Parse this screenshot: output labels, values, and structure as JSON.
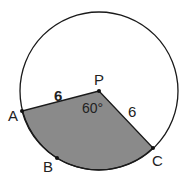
{
  "diagram": {
    "type": "circle-sector",
    "center_label": "P",
    "points": {
      "A": "A",
      "B": "B",
      "C": "C"
    },
    "radius_label_PA": "6",
    "radius_label_PC": "6",
    "angle_label": "60°",
    "colors": {
      "shade": "#8a8a8a",
      "stroke": "#1a1a1a",
      "background": "#ffffff"
    }
  }
}
